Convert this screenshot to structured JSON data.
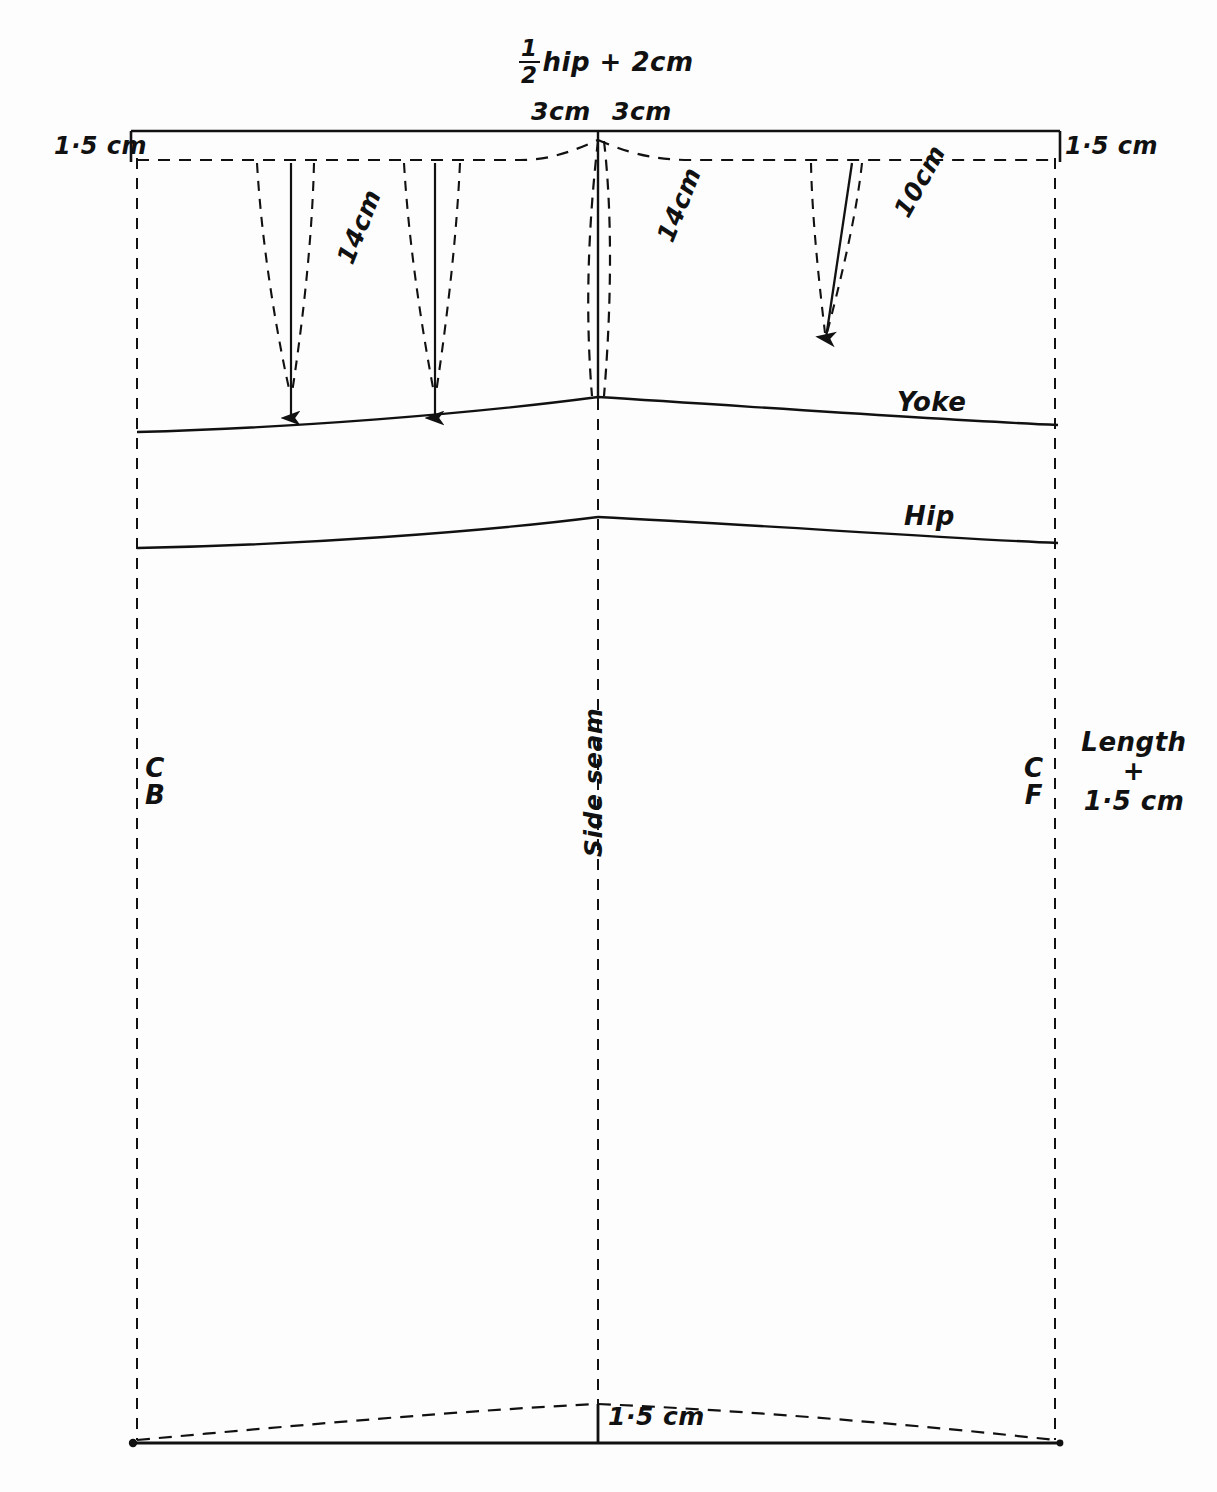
{
  "diagram": {
    "background_color": "#fdfdfd",
    "line_color": "#111111"
  },
  "labels": {
    "hip_formula_prefix": "hip + 2cm",
    "hip_formula_numerator": "1",
    "hip_formula_denominator": "2",
    "waist_take_out_left": "3cm",
    "waist_take_out_right": "3cm",
    "seam_allowance_left": "1·5 cm",
    "seam_allowance_right": "1·5 cm",
    "back_dart_length": "14cm",
    "front_side_length": "14cm",
    "front_dart_length": "10cm",
    "yoke_line": "Yoke",
    "hip_line": "Hip",
    "side_seam": "Side seam",
    "centre_back_top": "C",
    "centre_back_bottom": "B",
    "centre_front_top": "C",
    "centre_front_bottom": "F",
    "length_line_1": "Length",
    "length_line_2": "+",
    "length_line_3": "1·5 cm",
    "hem_allowance": "1·5 cm"
  },
  "measurements": {
    "half_hip_plus": "2cm",
    "waist_suppression_each_side": "3cm",
    "back_dart": "14cm",
    "front_dart": "10cm",
    "side_seam_dart": "14cm",
    "seam_allowance": "1.5cm",
    "hem_allowance": "1.5cm"
  }
}
